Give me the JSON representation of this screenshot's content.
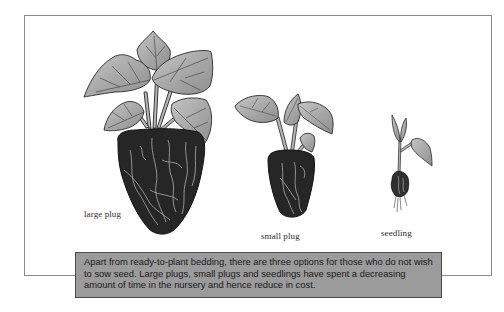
{
  "figure": {
    "plants": [
      {
        "id": "large-plug",
        "label": "large plug"
      },
      {
        "id": "small-plug",
        "label": "small plug"
      },
      {
        "id": "seedling",
        "label": "seedling"
      }
    ],
    "caption": "Apart from ready-to-plant bedding, there are three options for those who do not wish to sow seed. Large plugs, small plugs and seedlings have spent a decreasing amount of time in the nursery and hence reduce in cost.",
    "colors": {
      "frame_border": "#8c8c8c",
      "caption_background": "#9b9b9b",
      "caption_border": "#4a4a4a",
      "leaf_fill": "#a8a8a8",
      "root_ball": "#262626"
    }
  }
}
